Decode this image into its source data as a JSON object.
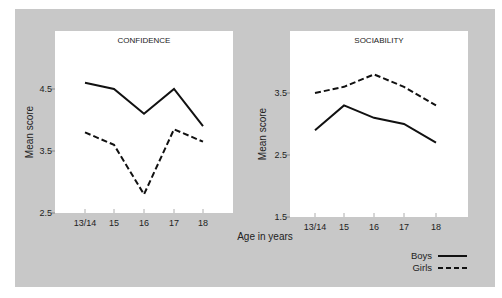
{
  "chart_data": [
    {
      "type": "line",
      "title": "CONFIDENCE",
      "xlabel": "Age in years",
      "ylabel": "Mean score",
      "categories": [
        "13/14",
        "15",
        "16",
        "17",
        "18"
      ],
      "ylim": [
        2.5,
        4.9
      ],
      "yticks": [
        "2.5",
        "3.5",
        "4.5"
      ],
      "ytick_values": [
        2.5,
        3.5,
        4.5
      ],
      "series": [
        {
          "name": "Boys",
          "style": "solid",
          "values": [
            4.6,
            4.5,
            4.1,
            4.5,
            3.9
          ]
        },
        {
          "name": "Girls",
          "style": "dashed",
          "values": [
            3.8,
            3.6,
            2.8,
            3.85,
            3.65
          ]
        }
      ],
      "grid": false
    },
    {
      "type": "line",
      "title": "SOCIABILITY",
      "xlabel": "Age in years",
      "ylabel": "Mean score",
      "categories": [
        "13/14",
        "15",
        "16",
        "17",
        "18"
      ],
      "ylim": [
        1.5,
        3.9
      ],
      "yticks": [
        "1.5",
        "2.5",
        "3.5"
      ],
      "ytick_values": [
        1.5,
        2.5,
        3.5
      ],
      "series": [
        {
          "name": "Boys",
          "style": "solid",
          "values": [
            2.9,
            3.3,
            3.1,
            3.0,
            2.7
          ]
        },
        {
          "name": "Girls",
          "style": "dashed",
          "values": [
            3.5,
            3.6,
            3.8,
            3.6,
            3.3
          ]
        }
      ],
      "grid": false
    }
  ],
  "shared": {
    "xlabel": "Age in years",
    "legend": [
      {
        "name": "Boys",
        "style": "solid"
      },
      {
        "name": "Girls",
        "style": "dashed"
      }
    ],
    "legend_position": "bottom-right"
  }
}
